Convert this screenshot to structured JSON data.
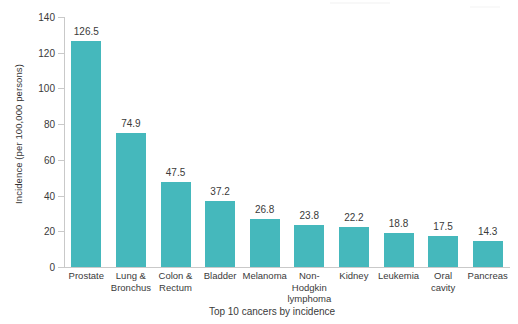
{
  "chart_data": {
    "type": "bar",
    "title": "",
    "xlabel": "Top 10 cancers by incidence",
    "ylabel": "Incidence (per 100,000 persons)",
    "categories": [
      "Prostate",
      "Lung &\nBronchus",
      "Colon &\nRectum",
      "Bladder",
      "Melanoma",
      "Non-\nHodgkin\nlymphoma",
      "Kidney",
      "Leukemia",
      "Oral\ncavity",
      "Pancreas"
    ],
    "values": [
      126.5,
      74.9,
      47.5,
      37.2,
      26.8,
      23.8,
      22.2,
      18.8,
      17.5,
      14.3
    ],
    "data_labels": [
      "126.5",
      "74.9",
      "47.5",
      "37.2",
      "26.8",
      "23.8",
      "22.2",
      "18.8",
      "17.5",
      "14.3"
    ],
    "ylim": [
      0,
      140
    ],
    "yticks": [
      0,
      20,
      40,
      60,
      80,
      100,
      120,
      140
    ],
    "ytick_labels": [
      "0",
      "20",
      "40",
      "60",
      "80",
      "100",
      "120",
      "140"
    ],
    "grid": false,
    "legend": null,
    "bar_color": "#45b8bc",
    "axis_color": "#c9c9c9",
    "text_color": "#3a3a3a",
    "background": "#ffffff"
  }
}
